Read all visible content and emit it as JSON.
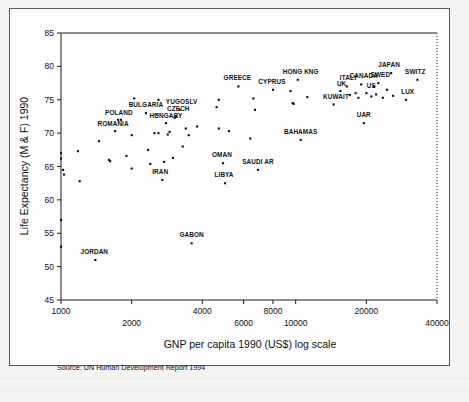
{
  "figure": {
    "type": "scatter-plot-scan",
    "source_note": "Source: UN Human Development Report 1994"
  },
  "chart_data": {
    "type": "scatter",
    "title": "",
    "xlabel": "GNP per capita 1990 (US$)  log scale",
    "ylabel": "Life Expectancy (M & F) 1990",
    "xscale": "log",
    "yscale": "linear",
    "xlim": [
      1000,
      40000
    ],
    "ylim": [
      45,
      85
    ],
    "grid": false,
    "legend": null,
    "xticks": [
      1000,
      2000,
      4000,
      6000,
      8000,
      10000,
      20000,
      40000
    ],
    "xtick_labels": [
      "1000",
      "2000",
      "4000",
      "6000",
      "8000",
      "10000",
      "20000",
      "40000"
    ],
    "xtick_rows": [
      0,
      1,
      0,
      1,
      0,
      1,
      0,
      1
    ],
    "yticks": [
      45,
      50,
      55,
      60,
      65,
      70,
      75,
      80,
      85
    ],
    "ytick_labels": [
      "45",
      "50",
      "55",
      "60",
      "65",
      "70",
      "75",
      "80",
      "85"
    ],
    "annotations": [
      {
        "label": "JORDAN",
        "x": 1400,
        "y": 51.0,
        "dx": -1,
        "dy": -6
      },
      {
        "label": "GABON",
        "x": 3600,
        "y": 53.5,
        "dx": 0,
        "dy": -6
      },
      {
        "label": "ROMANIA",
        "x": 1700,
        "y": 70.3,
        "dx": -2,
        "dy": -5
      },
      {
        "label": "POLAND",
        "x": 1800,
        "y": 72.0,
        "dx": -2,
        "dy": -5
      },
      {
        "label": "BULGARIA",
        "x": 2300,
        "y": 73.0,
        "dx": 0,
        "dy": -6
      },
      {
        "label": "HUNGARY",
        "x": 2800,
        "y": 71.5,
        "dx": 0,
        "dy": -5
      },
      {
        "label": "CZECH",
        "x": 3100,
        "y": 72.5,
        "dx": 2,
        "dy": -5
      },
      {
        "label": "YUGOSLV",
        "x": 3200,
        "y": 73.5,
        "dx": 2,
        "dy": -6
      },
      {
        "label": "IRAN",
        "x": 2700,
        "y": 63.0,
        "dx": -2,
        "dy": -6
      },
      {
        "label": "GREECE",
        "x": 5700,
        "y": 77.0,
        "dx": -1,
        "dy": -6
      },
      {
        "label": "CYPRUS",
        "x": 8000,
        "y": 76.5,
        "dx": -1,
        "dy": -6
      },
      {
        "label": "HONG KNG",
        "x": 10500,
        "y": 78.0,
        "dx": 0,
        "dy": -6
      },
      {
        "label": "BAHAMAS",
        "x": 10500,
        "y": 69.0,
        "dx": 0,
        "dy": -6
      },
      {
        "label": "OMAN",
        "x": 4900,
        "y": 65.5,
        "dx": -1,
        "dy": -6
      },
      {
        "label": "SAUDI AR",
        "x": 6900,
        "y": 64.5,
        "dx": 0,
        "dy": -6
      },
      {
        "label": "LIBYA",
        "x": 5000,
        "y": 62.5,
        "dx": -1,
        "dy": -6
      },
      {
        "label": "KUWAIT",
        "x": 15000,
        "y": 74.3,
        "dx": -1,
        "dy": -5
      },
      {
        "label": "UK",
        "x": 16000,
        "y": 76.3,
        "dx": -2,
        "dy": -5
      },
      {
        "label": "ITALY",
        "x": 17000,
        "y": 77.0,
        "dx": -1,
        "dy": -6
      },
      {
        "label": "CANADA",
        "x": 19500,
        "y": 77.3,
        "dx": 0,
        "dy": -6
      },
      {
        "label": "US",
        "x": 21000,
        "y": 76.0,
        "dx": 0,
        "dy": -5
      },
      {
        "label": "SWED",
        "x": 22500,
        "y": 77.5,
        "dx": 2,
        "dy": -6
      },
      {
        "label": "JAPAN",
        "x": 25000,
        "y": 79.0,
        "dx": 0,
        "dy": -6
      },
      {
        "label": "SWITZ",
        "x": 32000,
        "y": 78.0,
        "dx": 1,
        "dy": -6
      },
      {
        "label": "LUX",
        "x": 30000,
        "y": 75.0,
        "dx": 0,
        "dy": -6
      },
      {
        "label": "UAR",
        "x": 19500,
        "y": 71.5,
        "dx": 0,
        "dy": -6
      }
    ],
    "points": [
      {
        "x": 1000,
        "y": 67.0
      },
      {
        "x": 1000,
        "y": 66.2
      },
      {
        "x": 1020,
        "y": 64.5
      },
      {
        "x": 1030,
        "y": 63.8
      },
      {
        "x": 1000,
        "y": 57.0
      },
      {
        "x": 1000,
        "y": 53.0
      },
      {
        "x": 1180,
        "y": 67.3
      },
      {
        "x": 1200,
        "y": 62.8
      },
      {
        "x": 1400,
        "y": 51.0
      },
      {
        "x": 1450,
        "y": 68.8
      },
      {
        "x": 1600,
        "y": 66.0
      },
      {
        "x": 1620,
        "y": 65.8
      },
      {
        "x": 1700,
        "y": 70.3
      },
      {
        "x": 1750,
        "y": 72.0
      },
      {
        "x": 1800,
        "y": 72.0
      },
      {
        "x": 1900,
        "y": 66.6
      },
      {
        "x": 2000,
        "y": 69.7
      },
      {
        "x": 2000,
        "y": 64.7
      },
      {
        "x": 2050,
        "y": 75.2
      },
      {
        "x": 2300,
        "y": 73.0
      },
      {
        "x": 2350,
        "y": 67.5
      },
      {
        "x": 2400,
        "y": 65.4
      },
      {
        "x": 2500,
        "y": 70.0
      },
      {
        "x": 2550,
        "y": 72.8
      },
      {
        "x": 2600,
        "y": 70.0
      },
      {
        "x": 2600,
        "y": 75.0
      },
      {
        "x": 2700,
        "y": 63.0
      },
      {
        "x": 2750,
        "y": 65.7
      },
      {
        "x": 2800,
        "y": 71.5
      },
      {
        "x": 2850,
        "y": 69.8
      },
      {
        "x": 2900,
        "y": 70.2
      },
      {
        "x": 3000,
        "y": 66.3
      },
      {
        "x": 3050,
        "y": 72.3
      },
      {
        "x": 3100,
        "y": 72.5
      },
      {
        "x": 3200,
        "y": 73.5
      },
      {
        "x": 3300,
        "y": 68.0
      },
      {
        "x": 3400,
        "y": 70.7
      },
      {
        "x": 3500,
        "y": 69.7
      },
      {
        "x": 3600,
        "y": 53.5
      },
      {
        "x": 3800,
        "y": 71.0
      },
      {
        "x": 4600,
        "y": 73.9
      },
      {
        "x": 4700,
        "y": 75.0
      },
      {
        "x": 4700,
        "y": 70.7
      },
      {
        "x": 4900,
        "y": 65.5
      },
      {
        "x": 5000,
        "y": 62.5
      },
      {
        "x": 5200,
        "y": 70.3
      },
      {
        "x": 5700,
        "y": 77.0
      },
      {
        "x": 6400,
        "y": 69.2
      },
      {
        "x": 6600,
        "y": 75.2
      },
      {
        "x": 6700,
        "y": 73.5
      },
      {
        "x": 6900,
        "y": 64.5
      },
      {
        "x": 8000,
        "y": 76.5
      },
      {
        "x": 9500,
        "y": 76.3
      },
      {
        "x": 9700,
        "y": 74.5
      },
      {
        "x": 9800,
        "y": 74.4
      },
      {
        "x": 10200,
        "y": 78.0
      },
      {
        "x": 10500,
        "y": 69.0
      },
      {
        "x": 11200,
        "y": 75.4
      },
      {
        "x": 14500,
        "y": 74.3
      },
      {
        "x": 15500,
        "y": 76.3
      },
      {
        "x": 16500,
        "y": 77.0
      },
      {
        "x": 17000,
        "y": 75.7
      },
      {
        "x": 18000,
        "y": 76.0
      },
      {
        "x": 18500,
        "y": 75.3
      },
      {
        "x": 19000,
        "y": 77.3
      },
      {
        "x": 19500,
        "y": 71.5
      },
      {
        "x": 20000,
        "y": 76.0
      },
      {
        "x": 21000,
        "y": 75.5
      },
      {
        "x": 21500,
        "y": 77.0
      },
      {
        "x": 22000,
        "y": 75.8
      },
      {
        "x": 22500,
        "y": 77.5
      },
      {
        "x": 23500,
        "y": 75.3
      },
      {
        "x": 24500,
        "y": 76.5
      },
      {
        "x": 25500,
        "y": 79.0
      },
      {
        "x": 26000,
        "y": 75.6
      },
      {
        "x": 29500,
        "y": 75.0
      },
      {
        "x": 33000,
        "y": 78.0
      }
    ]
  }
}
